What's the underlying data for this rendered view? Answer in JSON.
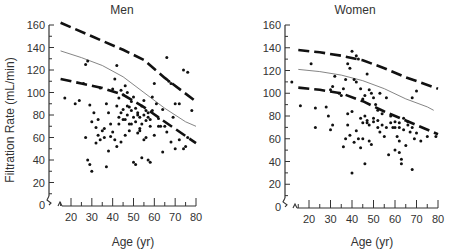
{
  "figure": {
    "ylabel": "Filtration Rate (mL/min)"
  },
  "chart_data": [
    {
      "type": "scatter",
      "title": "Men",
      "xlabel": "Age (yr)",
      "ylabel": "Filtration Rate (mL/min)",
      "xlim": [
        10,
        80
      ],
      "ylim": [
        0,
        160
      ],
      "xticks": [
        20,
        30,
        40,
        50,
        60,
        70,
        80
      ],
      "yticks": [
        0,
        20,
        40,
        60,
        80,
        100,
        120,
        140,
        160
      ],
      "grid": false,
      "layout": {
        "x0": 71,
        "x1": 196,
        "xv0": 20,
        "xv1": 80,
        "yaxis_x": 49,
        "y0": 205,
        "y1": 25,
        "axis_start_x": 58
      },
      "lines": [
        {
          "name": "upper bound",
          "style": "dashed",
          "points": [
            [
              15,
              162
            ],
            [
              30,
              150
            ],
            [
              45,
              138
            ],
            [
              55,
              129
            ],
            [
              65,
              113
            ],
            [
              80,
              92
            ]
          ]
        },
        {
          "name": "mean",
          "style": "solid",
          "points": [
            [
              15,
              137
            ],
            [
              25,
              131
            ],
            [
              35,
              124
            ],
            [
              45,
              114
            ],
            [
              55,
              100
            ],
            [
              65,
              86
            ],
            [
              75,
              74
            ],
            [
              80,
              70
            ]
          ]
        },
        {
          "name": "lower bound",
          "style": "dashed",
          "points": [
            [
              15,
              112
            ],
            [
              25,
              108
            ],
            [
              35,
              104
            ],
            [
              45,
              98
            ],
            [
              55,
              87
            ],
            [
              65,
              74
            ],
            [
              80,
              55
            ]
          ]
        }
      ],
      "points": [
        [
          17,
          95
        ],
        [
          22,
          90
        ],
        [
          24,
          93
        ],
        [
          26,
          108
        ],
        [
          27,
          125
        ],
        [
          28,
          128
        ],
        [
          29,
          89
        ],
        [
          30,
          74
        ],
        [
          31,
          82
        ],
        [
          32,
          69
        ],
        [
          33,
          76
        ],
        [
          34,
          104
        ],
        [
          35,
          66
        ],
        [
          36,
          60
        ],
        [
          37,
          90
        ],
        [
          38,
          82
        ],
        [
          39,
          61
        ],
        [
          40,
          103
        ],
        [
          41,
          112
        ],
        [
          42,
          124
        ],
        [
          43,
          95
        ],
        [
          44,
          102
        ],
        [
          45,
          98
        ],
        [
          46,
          106
        ],
        [
          47,
          100
        ],
        [
          48,
          87
        ],
        [
          49,
          92
        ],
        [
          50,
          96
        ],
        [
          51,
          74
        ],
        [
          52,
          80
        ],
        [
          53,
          68
        ],
        [
          54,
          88
        ],
        [
          55,
          93
        ],
        [
          56,
          75
        ],
        [
          57,
          82
        ],
        [
          58,
          70
        ],
        [
          59,
          96
        ],
        [
          60,
          108
        ],
        [
          61,
          90
        ],
        [
          62,
          77
        ],
        [
          63,
          70
        ],
        [
          64,
          85
        ],
        [
          65,
          70
        ],
        [
          66,
          131
        ],
        [
          67,
          110
        ],
        [
          68,
          108
        ],
        [
          69,
          78
        ],
        [
          70,
          90
        ],
        [
          72,
          90
        ],
        [
          74,
          120
        ],
        [
          76,
          118
        ],
        [
          78,
          84
        ],
        [
          27,
          60
        ],
        [
          28,
          40
        ],
        [
          29,
          36
        ],
        [
          30,
          30
        ],
        [
          32,
          55
        ],
        [
          33,
          62
        ],
        [
          34,
          58
        ],
        [
          36,
          68
        ],
        [
          37,
          34
        ],
        [
          38,
          48
        ],
        [
          39,
          72
        ],
        [
          40,
          65
        ],
        [
          41,
          58
        ],
        [
          42,
          52
        ],
        [
          43,
          72
        ],
        [
          44,
          56
        ],
        [
          45,
          76
        ],
        [
          46,
          62
        ],
        [
          47,
          80
        ],
        [
          48,
          66
        ],
        [
          49,
          72
        ],
        [
          50,
          38
        ],
        [
          51,
          36
        ],
        [
          52,
          64
        ],
        [
          53,
          66
        ],
        [
          54,
          42
        ],
        [
          55,
          58
        ],
        [
          56,
          60
        ],
        [
          57,
          40
        ],
        [
          58,
          38
        ],
        [
          60,
          62
        ],
        [
          62,
          70
        ],
        [
          64,
          47
        ],
        [
          66,
          65
        ],
        [
          68,
          56
        ],
        [
          70,
          50
        ],
        [
          72,
          58
        ],
        [
          74,
          50
        ],
        [
          75,
          52
        ],
        [
          76,
          60
        ],
        [
          42,
          88
        ],
        [
          43,
          78
        ],
        [
          44,
          82
        ],
        [
          45,
          85
        ],
        [
          46,
          76
        ],
        [
          47,
          88
        ],
        [
          48,
          72
        ],
        [
          49,
          84
        ],
        [
          50,
          78
        ],
        [
          51,
          86
        ],
        [
          52,
          82
        ],
        [
          53,
          78
        ],
        [
          54,
          72
        ],
        [
          55,
          80
        ],
        [
          56,
          84
        ],
        [
          57,
          78
        ],
        [
          58,
          76
        ],
        [
          59,
          84
        ]
      ]
    },
    {
      "type": "scatter",
      "title": "Women",
      "xlabel": "Age (yr)",
      "ylabel": "",
      "xlim": [
        10,
        80
      ],
      "ylim": [
        0,
        160
      ],
      "xticks": [
        20,
        30,
        40,
        50,
        60,
        70,
        80
      ],
      "yticks": [
        0,
        20,
        40,
        60,
        80,
        100,
        120,
        140,
        160
      ],
      "grid": false,
      "layout": {
        "x0": 309,
        "x1": 438,
        "xv0": 20,
        "xv1": 80,
        "yaxis_x": 285,
        "y0": 207,
        "y1": 25,
        "axis_start_x": 293
      },
      "lines": [
        {
          "name": "upper bound",
          "style": "dashed",
          "points": [
            [
              15,
              138
            ],
            [
              25,
              136
            ],
            [
              35,
              133
            ],
            [
              45,
              129
            ],
            [
              55,
              122
            ],
            [
              65,
              114
            ],
            [
              80,
              104
            ]
          ]
        },
        {
          "name": "mean",
          "style": "solid",
          "points": [
            [
              15,
              121
            ],
            [
              25,
              119
            ],
            [
              35,
              116
            ],
            [
              45,
              111
            ],
            [
              55,
              104
            ],
            [
              65,
              95
            ],
            [
              75,
              88
            ],
            [
              78,
              85
            ]
          ]
        },
        {
          "name": "lower bound",
          "style": "dashed",
          "points": [
            [
              15,
              105
            ],
            [
              25,
              103
            ],
            [
              35,
              100
            ],
            [
              45,
              93
            ],
            [
              55,
              84
            ],
            [
              65,
              76
            ],
            [
              80,
              64
            ]
          ]
        }
      ],
      "points": [
        [
          12,
          110
        ],
        [
          16,
          89
        ],
        [
          21,
          126
        ],
        [
          23,
          87
        ],
        [
          28,
          88
        ],
        [
          29,
          80
        ],
        [
          30,
          103
        ],
        [
          31,
          106
        ],
        [
          32,
          115
        ],
        [
          34,
          100
        ],
        [
          35,
          98
        ],
        [
          36,
          104
        ],
        [
          37,
          112
        ],
        [
          38,
          126
        ],
        [
          38,
          82
        ],
        [
          39,
          122
        ],
        [
          40,
          137
        ],
        [
          40,
          84
        ],
        [
          41,
          112
        ],
        [
          42,
          133
        ],
        [
          42,
          110
        ],
        [
          43,
          130
        ],
        [
          44,
          104
        ],
        [
          45,
          95
        ],
        [
          46,
          98
        ],
        [
          47,
          117
        ],
        [
          48,
          103
        ],
        [
          49,
          100
        ],
        [
          50,
          96
        ],
        [
          51,
          90
        ],
        [
          52,
          85
        ],
        [
          53,
          100
        ],
        [
          54,
          82
        ],
        [
          56,
          96
        ],
        [
          58,
          80
        ],
        [
          60,
          75
        ],
        [
          62,
          70
        ],
        [
          64,
          78
        ],
        [
          66,
          75
        ],
        [
          68,
          96
        ],
        [
          70,
          102
        ],
        [
          23,
          70
        ],
        [
          30,
          68
        ],
        [
          31,
          72
        ],
        [
          36,
          53
        ],
        [
          37,
          60
        ],
        [
          38,
          72
        ],
        [
          39,
          63
        ],
        [
          40,
          30
        ],
        [
          41,
          57
        ],
        [
          42,
          67
        ],
        [
          43,
          60
        ],
        [
          44,
          52
        ],
        [
          45,
          60
        ],
        [
          46,
          38
        ],
        [
          47,
          74
        ],
        [
          48,
          58
        ],
        [
          49,
          55
        ],
        [
          50,
          75
        ],
        [
          52,
          70
        ],
        [
          53,
          66
        ],
        [
          55,
          62
        ],
        [
          57,
          46
        ],
        [
          59,
          70
        ],
        [
          60,
          50
        ],
        [
          61,
          62
        ],
        [
          62,
          58
        ],
        [
          62,
          48
        ],
        [
          63,
          42
        ],
        [
          63,
          38
        ],
        [
          65,
          54
        ],
        [
          67,
          66
        ],
        [
          68,
          33
        ],
        [
          69,
          60
        ],
        [
          70,
          65
        ],
        [
          72,
          58
        ],
        [
          75,
          62
        ],
        [
          79,
          62
        ],
        [
          44,
          78
        ],
        [
          45,
          74
        ],
        [
          46,
          80
        ],
        [
          47,
          76
        ],
        [
          48,
          72
        ],
        [
          50,
          78
        ],
        [
          52,
          76
        ],
        [
          54,
          72
        ],
        [
          56,
          70
        ],
        [
          58,
          74
        ],
        [
          60,
          70
        ],
        [
          62,
          74
        ],
        [
          64,
          68
        ],
        [
          66,
          72
        ],
        [
          68,
          70
        ]
      ]
    }
  ]
}
